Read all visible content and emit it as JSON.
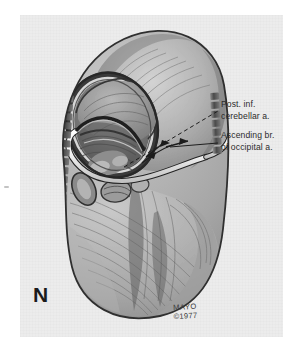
{
  "figure": {
    "panel_letter": "N",
    "background_color": "#ececec",
    "page_color": "#ffffff",
    "ink_color": "#2b2b2b"
  },
  "labels": [
    {
      "name": "post-inf-cerebellar-artery",
      "line1": "Post. inf.",
      "line2": "cerebellar a."
    },
    {
      "name": "ascending-branch-occipital-artery",
      "line1": "Ascending br.",
      "line2": "of occipital a."
    }
  ],
  "credit": {
    "institution": "MAYO",
    "copyright": "©1977"
  }
}
